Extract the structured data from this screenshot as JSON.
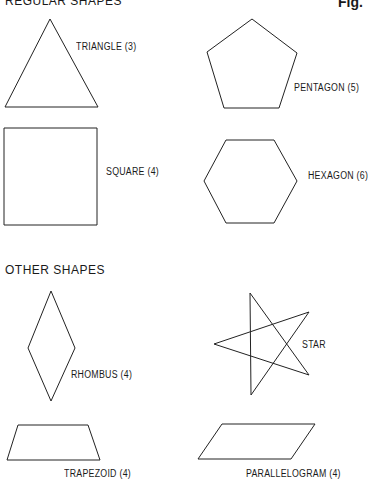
{
  "sections": {
    "regular": {
      "heading": "REGULAR SHAPES"
    },
    "other": {
      "heading": "OTHER SHAPES"
    }
  },
  "fig_label": "Fig.",
  "shapes": {
    "triangle": {
      "label": "TRIANGLE (3)",
      "sides": 3
    },
    "pentagon": {
      "label": "PENTAGON (5)",
      "sides": 5
    },
    "square": {
      "label": "SQUARE (4)",
      "sides": 4
    },
    "hexagon": {
      "label": "HEXAGON (6)",
      "sides": 6
    },
    "rhombus": {
      "label": "RHOMBUS (4)",
      "sides": 4
    },
    "star": {
      "label": "STAR"
    },
    "trapezoid": {
      "label": "TRAPEZOID (4)",
      "sides": 4
    },
    "parallelogram": {
      "label": "PARALLELOGRAM (4)",
      "sides": 4
    }
  },
  "colors": {
    "stroke": "#222222",
    "background": "#ffffff"
  }
}
